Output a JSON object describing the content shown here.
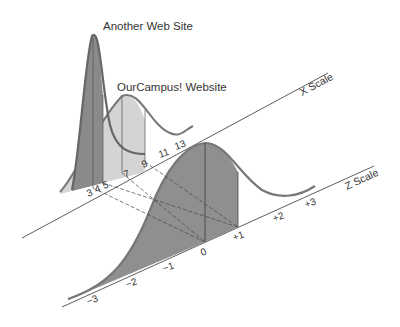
{
  "labels": {
    "another_site": "Another Web Site",
    "ourcampus_site": "OurCampus! Website",
    "x_scale": "X Scale",
    "z_scale": "Z Scale"
  },
  "x_ticks": [
    "3",
    "4",
    "5",
    "7",
    "9",
    "11",
    "13"
  ],
  "z_ticks": [
    "−3",
    "−2",
    "−1",
    "0",
    "+1",
    "+2",
    "+3"
  ],
  "colors": {
    "curve_stroke": "#777777",
    "dark_fill": "#8a8a8a",
    "light_fill": "#d0d0d0",
    "axis": "#333333"
  }
}
